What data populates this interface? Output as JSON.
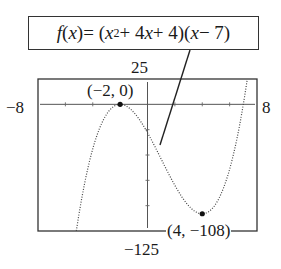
{
  "chart_data": {
    "type": "line",
    "function": "(x^2 + 4x + 4)(x - 7)",
    "equation_parts": {
      "lhs_f": "f",
      "lhs_x": "(x)",
      "eq": " = (",
      "x1": "x",
      "exp": "2",
      "mid": " + 4",
      "x2": "x",
      "mid2": " + 4)(",
      "x3": "x",
      "tail": " − 7)"
    },
    "window": {
      "xmin": -8,
      "xmax": 8,
      "ymin": -125,
      "ymax": 25,
      "xscl": 2,
      "yscl": 25
    },
    "window_labels": {
      "xmin": "−8",
      "xmax": "8",
      "ymin": "−125",
      "ymax": "25"
    },
    "annotations": [
      {
        "label": "(−2, 0)",
        "x": -2,
        "y": 0,
        "type": "relative maximum"
      },
      {
        "label": "(4, −108)",
        "x": 4,
        "y": -108,
        "type": "relative minimum"
      }
    ],
    "grid": false,
    "legend": null,
    "style": "dotted graphing-calculator trace"
  }
}
